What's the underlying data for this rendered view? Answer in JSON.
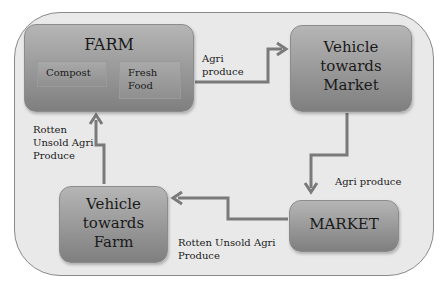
{
  "nodes": {
    "farm": {
      "label": "FARM",
      "children": [
        {
          "label": "Compost"
        },
        {
          "label": "Fresh Food"
        }
      ]
    },
    "vehicle_market": {
      "label": "Vehicle towards Market"
    },
    "market": {
      "label": "MARKET"
    },
    "vehicle_farm": {
      "label": "Vehicle towards Farm"
    }
  },
  "edges": [
    {
      "from": "farm",
      "to": "vehicle_market",
      "label": "Agri produce"
    },
    {
      "from": "vehicle_market",
      "to": "market",
      "label": "Agri produce"
    },
    {
      "from": "market",
      "to": "vehicle_farm",
      "label": "Rotten Unsold Agri Produce"
    },
    {
      "from": "vehicle_farm",
      "to": "farm",
      "label": "Rotten Unsold Agri Produce"
    }
  ],
  "text": {
    "farm": "FARM",
    "compost": "Compost",
    "fresh_1": "Fresh",
    "fresh_2": "Food",
    "vtm_1": "Vehicle",
    "vtm_2": "towards",
    "vtm_3": "Market",
    "market": "MARKET",
    "vtf_1": "Vehicle",
    "vtf_2": "towards",
    "vtf_3": "Farm",
    "e1_1": "Agri",
    "e1_2": "produce",
    "e2": "Agri produce",
    "e3_1": "Rotten Unsold Agri",
    "e3_2": "Produce",
    "e4_1": "Rotten",
    "e4_2": "Unsold Agri",
    "e4_3": "Produce"
  },
  "colors": {
    "background": "#e9e9e9",
    "box": "#9a9a9a",
    "arrow": "#7a7a7a"
  }
}
